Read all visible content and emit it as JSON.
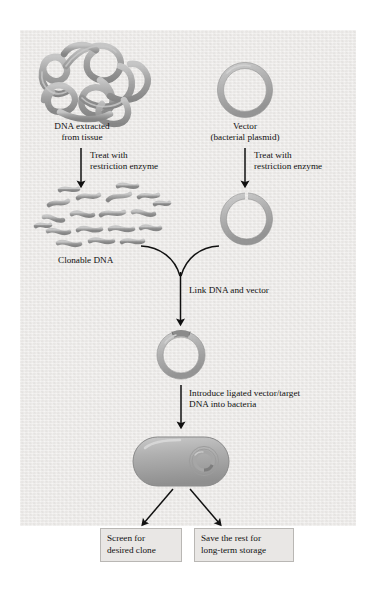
{
  "figure": {
    "panel": {
      "background_color": "#eeecea",
      "border_color": "#d8d6d3"
    },
    "colors": {
      "dna_gray": "#9a9a9a",
      "dna_gray_light": "#bdbdbd",
      "dna_outline": "#6f6f6f",
      "arrow_black": "#111111",
      "box_fill": "#e9e7e5",
      "box_border": "#b9b7b4",
      "text": "#111111"
    }
  },
  "labels": {
    "dna_source": "DNA extracted\nfrom tissue",
    "vector": "Vector\n(bacterial plasmid)",
    "treat_left": "Treat with\nrestriction enzyme",
    "treat_right": "Treat with\nrestriction enzyme",
    "clonable_dna": "Clonable DNA",
    "link_step": "Link DNA and vector",
    "introduce_step": "Introduce ligated vector/target\nDNA into bacteria",
    "screen_box": "Screen for\ndesired clone",
    "save_box": "Save the rest for\nlong-term storage"
  },
  "shapes": {
    "tangled_dna": "tangled-dna-strand",
    "plasmid_circle": "closed-plasmid-circle",
    "fragmented_dna": "restriction-fragments",
    "cut_plasmid": "linearized-open-plasmid",
    "ligated_plasmid": "recombinant-plasmid",
    "bacterium": "bacterium-with-plasmid"
  },
  "steps": [
    {
      "id": "step-extract",
      "label": "DNA extracted\nfrom tissue"
    },
    {
      "id": "step-vector",
      "label": "Vector\n(bacterial plasmid)"
    },
    {
      "id": "step-digest-dna",
      "label": "Treat with\nrestriction enzyme"
    },
    {
      "id": "step-digest-vector",
      "label": "Treat with\nrestriction enzyme"
    },
    {
      "id": "step-clonable",
      "label": "Clonable DNA"
    },
    {
      "id": "step-ligate",
      "label": "Link DNA and vector"
    },
    {
      "id": "step-transform",
      "label": "Introduce ligated vector/target\nDNA into bacteria"
    },
    {
      "id": "step-screen",
      "label": "Screen for\ndesired clone"
    },
    {
      "id": "step-store",
      "label": "Save the rest for\nlong-term storage"
    }
  ]
}
